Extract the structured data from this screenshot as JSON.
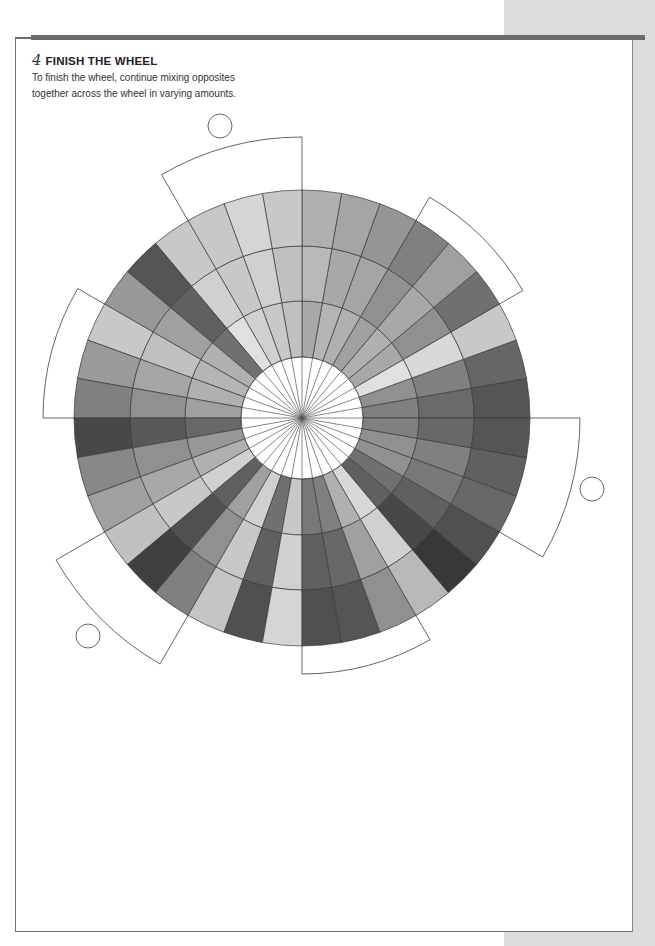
{
  "section": {
    "step_number": "4",
    "title": "FINISH THE WHEEL",
    "description_line1": "To finish the wheel, continue mixing opposites",
    "description_line2": "together across the wheel in varying amounts."
  },
  "colors": {
    "frame": "#6e6e6e",
    "top_bar": "#6a6a6a",
    "side_strip": "#dcdcdc",
    "wheel_line": "#3a3a3a",
    "tab_line": "#666666"
  },
  "wheel": {
    "center": [
      302,
      418
    ],
    "radii": [
      61,
      117,
      172,
      228
    ],
    "segments": 36,
    "segment_degrees": 10,
    "wedge_grays": [
      [
        "#808080",
        "#6a6a6a",
        "#555555"
      ],
      [
        "#909090",
        "#808080",
        "#666666"
      ],
      [
        "#e0e0e0",
        "#d8d8d8",
        "#c8c8c8"
      ],
      [
        "#a8a8a8",
        "#909090",
        "#707070"
      ],
      [
        "#b0b0b0",
        "#a8a8a8",
        "#a0a0a0"
      ],
      [
        "#a0a0a0",
        "#909090",
        "#808080"
      ],
      [
        "#b0b0b0",
        "#a5a5a5",
        "#959595"
      ],
      [
        "#b5b5b5",
        "#a8a8a8",
        "#a5a5a5"
      ],
      [
        "#a8a8a8",
        "#b8b8b8",
        "#b0b0b0"
      ],
      [
        "#c0c0c0",
        "#c0c0c0",
        "#c8c8c8"
      ],
      [
        "#c8c8c8",
        "#d0d0d0",
        "#d5d5d5"
      ],
      [
        "#d0d0d0",
        "#c8c8c8",
        "#c8c8c8"
      ],
      [
        "#e0e0e0",
        "#d0d0d0",
        "#c8c8c8"
      ],
      [
        "#707070",
        "#606060",
        "#555555"
      ],
      [
        "#b0b0b0",
        "#a0a0a0",
        "#989898"
      ],
      [
        "#b5b5b5",
        "#c0c0c0",
        "#c8c8c8"
      ],
      [
        "#b0b0b0",
        "#a5a5a5",
        "#9a9a9a"
      ],
      [
        "#a0a0a0",
        "#909090",
        "#808080"
      ],
      [
        "#686868",
        "#585858",
        "#484848"
      ],
      [
        "#989898",
        "#909090",
        "#888888"
      ],
      [
        "#b0b0b0",
        "#a8a8a8",
        "#a0a0a0"
      ],
      [
        "#d0d0d0",
        "#c8c8c8",
        "#c0c0c0"
      ],
      [
        "#606060",
        "#505050",
        "#404040"
      ],
      [
        "#a0a0a0",
        "#909090",
        "#808080"
      ],
      [
        "#d0d0d0",
        "#c8c8c8",
        "#c5c5c5"
      ],
      [
        "#707070",
        "#606060",
        "#505050"
      ],
      [
        "#c8c8c8",
        "#d0d0d0",
        "#d5d5d5"
      ],
      [
        "#787878",
        "#606060",
        "#505050"
      ],
      [
        "#808080",
        "#686868",
        "#555555"
      ],
      [
        "#b0b0b0",
        "#a0a0a0",
        "#909090"
      ],
      [
        "#d8d8d8",
        "#d0d0d0",
        "#b8b8b8"
      ],
      [
        "#606060",
        "#484848",
        "#383838"
      ],
      [
        "#707070",
        "#606060",
        "#505050"
      ],
      [
        "#909090",
        "#787878",
        "#686868"
      ],
      [
        "#909090",
        "#808080",
        "#606060"
      ],
      [
        "#808080",
        "#686868",
        "#555555"
      ]
    ],
    "tabs": [
      {
        "from": 330,
        "to": 360,
        "r_outer": 278
      },
      {
        "from": 30,
        "to": 60,
        "r_outer": 255
      },
      {
        "from": 90,
        "to": 120,
        "r_outer": 281
      },
      {
        "from": 150,
        "to": 180,
        "r_outer": 259
      },
      {
        "from": 210,
        "to": 240,
        "r_outer": 284
      },
      {
        "from": 270,
        "to": 300,
        "r_outer": 256
      }
    ],
    "circles": [
      {
        "cx": 220,
        "cy": 126,
        "r": 12
      },
      {
        "cx": 592,
        "cy": 489,
        "r": 12
      },
      {
        "cx": 88,
        "cy": 636,
        "r": 12
      }
    ]
  }
}
